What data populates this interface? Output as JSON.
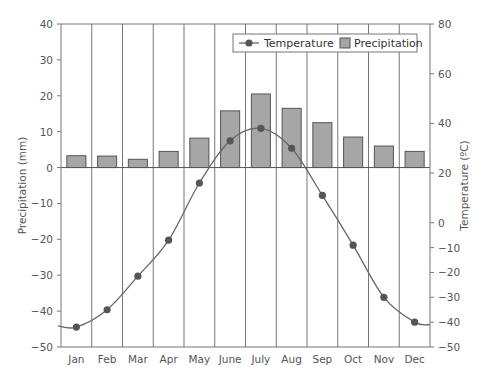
{
  "chart_data": {
    "type": "bar+line",
    "title": "",
    "categories": [
      "Jan",
      "Feb",
      "Mar",
      "Apr",
      "May",
      "June",
      "July",
      "Aug",
      "Sep",
      "Oct",
      "Nov",
      "Dec"
    ],
    "series": [
      {
        "name": "Precipitation",
        "type": "bar",
        "axis": "left",
        "values": [
          3.3,
          3.2,
          2.3,
          4.5,
          8.2,
          15.8,
          20.5,
          16.5,
          12.5,
          8.5,
          6.0,
          4.5
        ],
        "color": "#a6a6a6"
      },
      {
        "name": "Temperature",
        "type": "line",
        "axis": "right",
        "values": [
          -42,
          -35,
          -21.5,
          -7,
          16,
          33,
          38,
          30,
          11,
          -9,
          -30,
          -40
        ],
        "color": "#595959"
      }
    ],
    "left_axis": {
      "label": "Precipitation (mm)",
      "ylim": [
        -50,
        40
      ],
      "ticks": [
        40,
        30,
        20,
        10,
        0,
        -10,
        -20,
        -30,
        -40,
        -50
      ]
    },
    "right_axis": {
      "label": "Temperature (ºC)",
      "ylim": [
        -50,
        80
      ],
      "ticks": [
        80,
        60,
        40,
        20,
        0,
        -10,
        -20,
        -30,
        -40,
        -50
      ]
    },
    "legend": {
      "position": "top-right",
      "entries": [
        "Temperature",
        "Precipitation"
      ]
    },
    "grid": {
      "vertical": true,
      "horizontal": false
    }
  }
}
